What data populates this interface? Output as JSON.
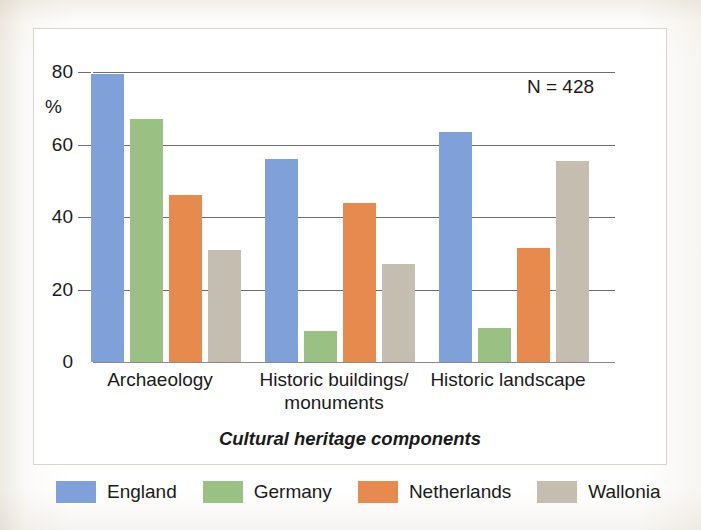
{
  "chart_data": {
    "type": "bar",
    "title": "",
    "subtitle": "",
    "xlabel": "Cultural heritage components",
    "ylabel": "%",
    "ylim": [
      0,
      80
    ],
    "yticks": [
      0,
      20,
      40,
      60,
      80
    ],
    "ytick_labels": [
      "0",
      "20",
      "40",
      "60",
      "80"
    ],
    "grid": true,
    "legend_position": "bottom",
    "annotation": "N = 428",
    "categories": [
      "Archaeology",
      "Historic buildings/\nmonuments",
      "Historic landscape"
    ],
    "series": [
      {
        "name": "England",
        "color": "#7fa0d8",
        "values": [
          79.5,
          56.0,
          63.5
        ]
      },
      {
        "name": "Germany",
        "color": "#9ac083",
        "values": [
          67.0,
          8.5,
          9.5
        ]
      },
      {
        "name": "Netherlands",
        "color": "#e68a4e",
        "values": [
          46.0,
          44.0,
          31.5
        ]
      },
      {
        "name": "Wallonia",
        "color": "#c4bdb0",
        "values": [
          31.0,
          27.0,
          55.5
        ]
      }
    ]
  },
  "axis": {
    "y_unit_label": "%",
    "x_title": "Cultural heritage components"
  },
  "annotation": {
    "sample_size": "N = 428"
  },
  "legend": {
    "items": [
      {
        "label": "England",
        "color": "#7fa0d8"
      },
      {
        "label": "Germany",
        "color": "#9ac083"
      },
      {
        "label": "Netherlands",
        "color": "#e68a4e"
      },
      {
        "label": "Wallonia",
        "color": "#c4bdb0"
      }
    ]
  }
}
